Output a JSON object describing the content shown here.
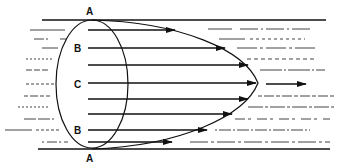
{
  "diagram": {
    "labels": {
      "top_wall": "A",
      "upper_mid": "B",
      "center": "C",
      "lower_mid": "B",
      "bottom_wall": "A"
    },
    "colors": {
      "stroke": "#111111",
      "background": "#ffffff",
      "dash": "#555555"
    },
    "profile": "parabolic",
    "velocity_arrows": 7
  }
}
